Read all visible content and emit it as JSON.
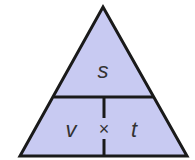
{
  "diagram": {
    "type": "formula-triangle",
    "top": "s",
    "bottom_left": "v",
    "bottom_right": "t",
    "operator": "×",
    "fill_color": "#c8caf2",
    "stroke_color": "#1a1a1a"
  }
}
